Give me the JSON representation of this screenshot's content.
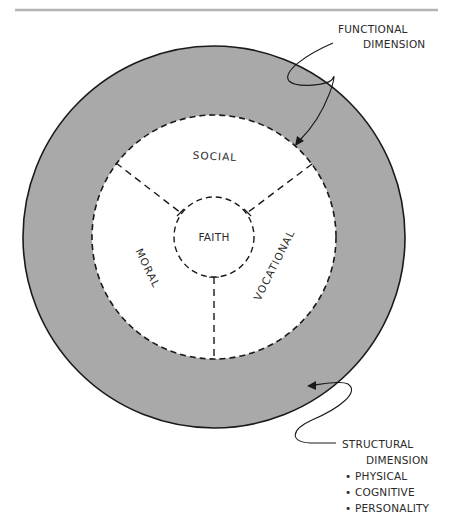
{
  "diagram": {
    "type": "concentric-circles",
    "colors": {
      "ring_fill": "#a9a9a9",
      "inner_fill": "#ffffff",
      "stroke": "#1a1a1a",
      "rule": "#b4b4b4"
    },
    "outer_ring": {
      "label_lines": [
        "STRUCTURAL",
        "DIMENSION"
      ],
      "bullets": [
        "PHYSICAL",
        "COGNITIVE",
        "PERSONALITY"
      ]
    },
    "inner_boundary": {
      "label_lines": [
        "FUNCTIONAL",
        "DIMENSION"
      ]
    },
    "sectors": {
      "top": "SOCIAL",
      "left": "MORAL",
      "right": "VOCATIONAL"
    },
    "center": "FAITH",
    "bullet_glyph": "•"
  }
}
